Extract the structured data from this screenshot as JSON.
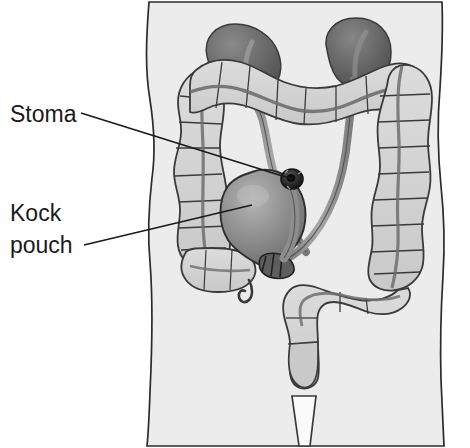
{
  "figure": {
    "kind": "medical-illustration",
    "background_color": "#ffffff",
    "body_fill": "#ececec",
    "body_outline_color": "#2b2b2b",
    "colon_fill": "#d4d4d4",
    "colon_outline_color": "#3a3a3a",
    "kidney_fill": "#6e6e6e",
    "pouch_fill": "#8a8a8a",
    "ureter_fill": "#9a9a9a",
    "stoma_color": "#2a2a2a",
    "leader_line_color": "#1a1a1a"
  },
  "labels": [
    {
      "id": "stoma",
      "text": "Stoma",
      "lines": [
        "Stoma"
      ],
      "x": 10,
      "y": 120,
      "leader": {
        "x1": 81,
        "y1": 113,
        "x2": 292,
        "y2": 179
      }
    },
    {
      "id": "kock-pouch",
      "text": "Kock pouch",
      "lines": [
        "Kock",
        "pouch"
      ],
      "x": 10,
      "y": 218,
      "leader": {
        "x1": 84,
        "y1": 245,
        "x2": 252,
        "y2": 205
      }
    }
  ],
  "anatomy": [
    {
      "id": "torso",
      "name": "abdomen-torso-outline"
    },
    {
      "id": "kidney-left",
      "name": "left-kidney"
    },
    {
      "id": "kidney-right",
      "name": "right-kidney"
    },
    {
      "id": "ureter-left",
      "name": "left-ureter"
    },
    {
      "id": "ureter-right",
      "name": "right-ureter"
    },
    {
      "id": "ascending-colon",
      "name": "ascending-colon"
    },
    {
      "id": "transverse-colon",
      "name": "transverse-colon"
    },
    {
      "id": "descending-colon",
      "name": "descending-colon"
    },
    {
      "id": "sigmoid-colon",
      "name": "sigmoid-colon"
    },
    {
      "id": "rectum",
      "name": "rectum"
    },
    {
      "id": "anal-canal",
      "name": "anal-canal"
    },
    {
      "id": "cecum",
      "name": "cecum"
    },
    {
      "id": "appendix",
      "name": "appendix"
    },
    {
      "id": "kock-pouch-body",
      "name": "kock-pouch-reservoir"
    },
    {
      "id": "pouch-neck",
      "name": "kock-pouch-nipple-valve"
    },
    {
      "id": "stoma-opening",
      "name": "stoma-opening"
    }
  ]
}
